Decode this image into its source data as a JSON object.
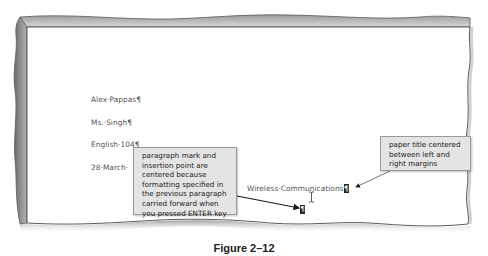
{
  "document": {
    "lines": [
      {
        "text": "Alex·Pappas¶"
      },
      {
        "text": "Ms.·Singh¶"
      },
      {
        "text": "English·104¶"
      },
      {
        "text": "28·March·"
      }
    ],
    "title_line": "Wireless·Communications",
    "title_pilcrow": "¶",
    "empty_paragraph_mark": "¶"
  },
  "callouts": {
    "left": {
      "lines": [
        "paragraph mark and",
        "insertion point are",
        "centered because",
        "formatting specified in",
        "the previous paragraph",
        "carried forward when",
        "you pressed ENTER key"
      ]
    },
    "right": {
      "lines": [
        "paper title centered",
        "between left and",
        "right margins"
      ]
    }
  },
  "icons": {
    "mouse_pointer": "i-beam-cursor-icon"
  },
  "caption": "Figure 2–12",
  "colors": {
    "page_background": "#ffffff",
    "callout_background": "#e4e4e4",
    "callout_border": "#9a9a9a",
    "document_text": "#555555",
    "frame_edge": "#7a7a7a"
  }
}
